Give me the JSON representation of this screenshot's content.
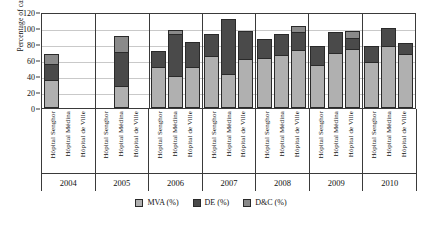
{
  "chart_data": {
    "type": "bar",
    "subtype": "stacked-bar",
    "title": "",
    "xlabel": "",
    "ylabel": "Percentage of cases (%)",
    "ylim": [
      0,
      120
    ],
    "yticks": [
      0,
      20,
      40,
      60,
      80,
      100,
      120
    ],
    "grid": true,
    "legend_position": "bottom",
    "legend": [
      "MVA (%)",
      "DE (%)",
      "D&C (%)"
    ],
    "series_colors": [
      "#b0b0b0",
      "#4a4a4a",
      "#8a8a8a"
    ],
    "years": [
      "2004",
      "2005",
      "2006",
      "2007",
      "2008",
      "2009",
      "2010"
    ],
    "hospitals": [
      "Hôpital Senghor",
      "Hôpital Médina",
      "Hôpital de Ville"
    ],
    "series": [
      {
        "name": "MVA (%)",
        "values": [
          [
            35,
            null,
            null
          ],
          [
            null,
            27,
            null
          ],
          [
            51,
            40,
            51
          ],
          [
            65,
            43,
            61
          ],
          [
            63,
            66,
            73
          ],
          [
            54,
            69,
            74
          ],
          [
            58,
            77,
            68
          ]
        ]
      },
      {
        "name": "DE (%)",
        "values": [
          [
            20,
            null,
            null
          ],
          [
            null,
            43,
            null
          ],
          [
            20,
            52,
            31
          ],
          [
            28,
            68,
            35
          ],
          [
            23,
            26,
            22
          ],
          [
            24,
            26,
            14
          ],
          [
            20,
            23,
            13
          ]
        ]
      },
      {
        "name": "D&C (%)",
        "values": [
          [
            12,
            null,
            null
          ],
          [
            null,
            20,
            null
          ],
          [
            0,
            5,
            0
          ],
          [
            0,
            0,
            0
          ],
          [
            0,
            0,
            8
          ],
          [
            0,
            0,
            8
          ],
          [
            0,
            0,
            0
          ]
        ]
      }
    ],
    "groups": [
      {
        "year": "2004",
        "bars": [
          {
            "hospital": "Hôpital Senghor",
            "segments": [
              35,
              20,
              12
            ],
            "total": 67
          },
          {
            "hospital": "Hôpital Médina",
            "segments": [
              0,
              0,
              0
            ],
            "total": 0
          },
          {
            "hospital": "Hôpital de Ville",
            "segments": [
              0,
              0,
              0
            ],
            "total": 0
          }
        ]
      },
      {
        "year": "2005",
        "bars": [
          {
            "hospital": "Hôpital Senghor",
            "segments": [
              0,
              0,
              0
            ],
            "total": 0
          },
          {
            "hospital": "Hôpital Médina",
            "segments": [
              27,
              43,
              20
            ],
            "total": 90
          },
          {
            "hospital": "Hôpital de Ville",
            "segments": [
              0,
              0,
              0
            ],
            "total": 0
          }
        ]
      },
      {
        "year": "2006",
        "bars": [
          {
            "hospital": "Hôpital Senghor",
            "segments": [
              51,
              20,
              0
            ],
            "total": 71
          },
          {
            "hospital": "Hôpital Médina",
            "segments": [
              40,
              52,
              5
            ],
            "total": 97
          },
          {
            "hospital": "Hôpital de Ville",
            "segments": [
              51,
              31,
              0
            ],
            "total": 82
          }
        ]
      },
      {
        "year": "2007",
        "bars": [
          {
            "hospital": "Hôpital Senghor",
            "segments": [
              65,
              28,
              0
            ],
            "total": 93
          },
          {
            "hospital": "Hôpital Médina",
            "segments": [
              43,
              68,
              0
            ],
            "total": 111
          },
          {
            "hospital": "Hôpital de Ville",
            "segments": [
              61,
              35,
              0
            ],
            "total": 96
          }
        ]
      },
      {
        "year": "2008",
        "bars": [
          {
            "hospital": "Hôpital Senghor",
            "segments": [
              63,
              23,
              0
            ],
            "total": 86
          },
          {
            "hospital": "Hôpital Médina",
            "segments": [
              66,
              26,
              0
            ],
            "total": 92
          },
          {
            "hospital": "Hôpital de Ville",
            "segments": [
              73,
              22,
              8
            ],
            "total": 103
          }
        ]
      },
      {
        "year": "2009",
        "bars": [
          {
            "hospital": "Hôpital Senghor",
            "segments": [
              54,
              24,
              0
            ],
            "total": 78
          },
          {
            "hospital": "Hôpital Médina",
            "segments": [
              69,
              26,
              0
            ],
            "total": 95
          },
          {
            "hospital": "Hôpital de Ville",
            "segments": [
              74,
              14,
              8
            ],
            "total": 96
          }
        ]
      },
      {
        "year": "2010",
        "bars": [
          {
            "hospital": "Hôpital Senghor",
            "segments": [
              58,
              20,
              0
            ],
            "total": 78
          },
          {
            "hospital": "Hôpital Médina",
            "segments": [
              77,
              23,
              0
            ],
            "total": 100
          },
          {
            "hospital": "Hôpital de Ville",
            "segments": [
              68,
              13,
              0
            ],
            "total": 81
          }
        ]
      }
    ]
  }
}
